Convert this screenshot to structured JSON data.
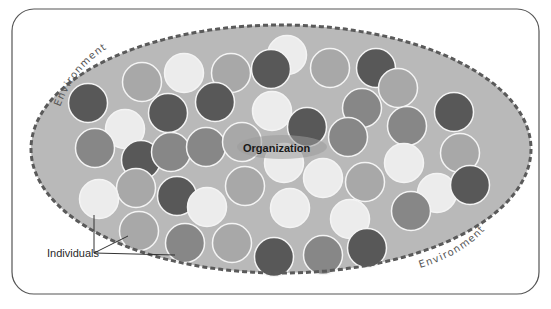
{
  "diagram": {
    "center_label": "Organization",
    "boundary_labels": [
      "Environment",
      "Environment"
    ],
    "callout_label": "Individuals",
    "colors": {
      "frame_stroke": "#555555",
      "ellipse_fill": "#b9b9b9",
      "ellipse_dash": "#5a5a5a",
      "circle_dark": "#585858",
      "circle_mid": "#878787",
      "circle_light": "#a8a8a8",
      "circle_white": "#ececec",
      "circle_stroke": "#f4f4f4"
    },
    "circles": [
      {
        "x": 88,
        "y": 103,
        "tone": "dark"
      },
      {
        "x": 142,
        "y": 82,
        "tone": "light"
      },
      {
        "x": 184,
        "y": 73,
        "tone": "white"
      },
      {
        "x": 231,
        "y": 73,
        "tone": "light"
      },
      {
        "x": 287,
        "y": 55,
        "tone": "white"
      },
      {
        "x": 271,
        "y": 69,
        "tone": "dark"
      },
      {
        "x": 330,
        "y": 68,
        "tone": "light"
      },
      {
        "x": 376,
        "y": 68,
        "tone": "dark"
      },
      {
        "x": 398,
        "y": 88,
        "tone": "light"
      },
      {
        "x": 454,
        "y": 112,
        "tone": "dark"
      },
      {
        "x": 168,
        "y": 113,
        "tone": "dark"
      },
      {
        "x": 215,
        "y": 102,
        "tone": "dark"
      },
      {
        "x": 125,
        "y": 129,
        "tone": "white"
      },
      {
        "x": 272,
        "y": 111,
        "tone": "white"
      },
      {
        "x": 307,
        "y": 127,
        "tone": "dark"
      },
      {
        "x": 362,
        "y": 108,
        "tone": "mid"
      },
      {
        "x": 348,
        "y": 137,
        "tone": "mid"
      },
      {
        "x": 407,
        "y": 126,
        "tone": "mid"
      },
      {
        "x": 95,
        "y": 148,
        "tone": "mid"
      },
      {
        "x": 141,
        "y": 160,
        "tone": "dark"
      },
      {
        "x": 171,
        "y": 152,
        "tone": "mid"
      },
      {
        "x": 206,
        "y": 147,
        "tone": "mid"
      },
      {
        "x": 242,
        "y": 142,
        "tone": "light"
      },
      {
        "x": 284,
        "y": 163,
        "tone": "white"
      },
      {
        "x": 404,
        "y": 163,
        "tone": "white"
      },
      {
        "x": 460,
        "y": 153,
        "tone": "light"
      },
      {
        "x": 136,
        "y": 188,
        "tone": "light"
      },
      {
        "x": 177,
        "y": 196,
        "tone": "dark"
      },
      {
        "x": 207,
        "y": 207,
        "tone": "white"
      },
      {
        "x": 245,
        "y": 186,
        "tone": "light"
      },
      {
        "x": 323,
        "y": 178,
        "tone": "white"
      },
      {
        "x": 365,
        "y": 182,
        "tone": "light"
      },
      {
        "x": 99,
        "y": 199,
        "tone": "white"
      },
      {
        "x": 437,
        "y": 193,
        "tone": "white"
      },
      {
        "x": 470,
        "y": 185,
        "tone": "dark"
      },
      {
        "x": 290,
        "y": 208,
        "tone": "white"
      },
      {
        "x": 350,
        "y": 219,
        "tone": "white"
      },
      {
        "x": 411,
        "y": 211,
        "tone": "mid"
      },
      {
        "x": 139,
        "y": 231,
        "tone": "light"
      },
      {
        "x": 185,
        "y": 243,
        "tone": "mid"
      },
      {
        "x": 232,
        "y": 243,
        "tone": "light"
      },
      {
        "x": 274,
        "y": 257,
        "tone": "dark"
      },
      {
        "x": 323,
        "y": 255,
        "tone": "mid"
      },
      {
        "x": 367,
        "y": 248,
        "tone": "dark"
      }
    ]
  }
}
